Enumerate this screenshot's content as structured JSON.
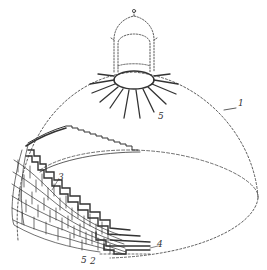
{
  "figure": {
    "colors": {
      "ink": "#333333",
      "background": "#ffffff"
    },
    "labels": [
      {
        "id": "1",
        "text": "1",
        "refers_to": "dome outline"
      },
      {
        "id": "2",
        "text": "2",
        "refers_to": "lower brick course"
      },
      {
        "id": "3",
        "text": "3",
        "refers_to": "stepped brick courses"
      },
      {
        "id": "4",
        "text": "4",
        "refers_to": "course edge"
      },
      {
        "id": "5a",
        "text": "5",
        "refers_to": "radial ribs at oculus"
      },
      {
        "id": "5b",
        "text": "5",
        "refers_to": "brick unit"
      }
    ]
  }
}
